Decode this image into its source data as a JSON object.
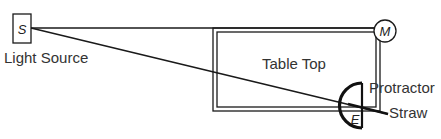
{
  "diagram": {
    "labels": {
      "source_letter": "S",
      "source_label": "Light Source",
      "mirror_letter": "M",
      "table_label": "Table Top",
      "protractor_label": "Protractor",
      "straw_label": "Straw",
      "eye_letter": "E"
    },
    "colors": {
      "stroke": "#1a1a1a",
      "text": "#333333",
      "background": "#ffffff"
    }
  }
}
